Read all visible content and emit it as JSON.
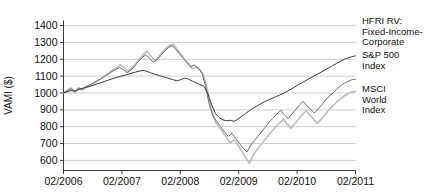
{
  "chart_data": {
    "type": "line",
    "title": "",
    "xlabel": "",
    "ylabel": "VAMI ($)",
    "ylim": [
      540,
      1430
    ],
    "yticks": [
      600,
      700,
      800,
      900,
      1000,
      1100,
      1200,
      1300,
      1400
    ],
    "ytick_labels": [
      "600",
      "700",
      "800",
      "900",
      "1000",
      "1100",
      "1200",
      "1300",
      "1400"
    ],
    "xticks": [
      "02/2006",
      "02/2007",
      "02/2008",
      "02/2009",
      "02/2010",
      "02/2011"
    ],
    "xlim": [
      0,
      60
    ],
    "grid": true,
    "legend_position": "right-outside",
    "series": [
      {
        "name": "HFRI RV: Fixed-Income-Corporate",
        "color": "#3c3c3c",
        "width": 1.0,
        "values": [
          1000,
          1008,
          1014,
          1012,
          1020,
          1028,
          1033,
          1040,
          1047,
          1055,
          1062,
          1070,
          1078,
          1085,
          1092,
          1098,
          1105,
          1110,
          1118,
          1124,
          1130,
          1134,
          1128,
          1120,
          1112,
          1105,
          1098,
          1092,
          1085,
          1078,
          1072,
          1080,
          1088,
          1082,
          1070,
          1060,
          1050,
          1040,
          1000,
          935,
          880,
          855,
          840,
          835,
          838,
          832,
          845,
          862,
          878,
          895,
          910,
          922,
          936,
          948,
          958,
          968,
          978,
          988,
          998,
          1010,
          1022,
          1036,
          1050,
          1062,
          1075,
          1088,
          1100,
          1112,
          1124,
          1138,
          1150,
          1162,
          1175,
          1188,
          1200,
          1208,
          1215,
          1220
        ]
      },
      {
        "name": "S&P 500 Index",
        "color": "#6e6e6e",
        "width": 1.0,
        "values": [
          1000,
          1012,
          1025,
          1008,
          1030,
          1022,
          1038,
          1048,
          1060,
          1072,
          1085,
          1098,
          1112,
          1128,
          1140,
          1152,
          1138,
          1120,
          1135,
          1160,
          1185,
          1210,
          1228,
          1205,
          1182,
          1198,
          1222,
          1248,
          1268,
          1282,
          1258,
          1232,
          1205,
          1180,
          1155,
          1165,
          1148,
          1120,
          1035,
          925,
          860,
          830,
          800,
          770,
          742,
          760,
          730,
          700,
          672,
          650,
          690,
          718,
          745,
          772,
          800,
          828,
          852,
          875,
          898,
          870,
          848,
          875,
          900,
          928,
          950,
          925,
          902,
          880,
          905,
          930,
          958,
          982,
          1000,
          1022,
          1042,
          1058,
          1068,
          1078,
          1082
        ]
      },
      {
        "name": "MSCI World Index",
        "color": "#bdbdbd",
        "width": 1.6,
        "values": [
          1000,
          1015,
          1030,
          1002,
          1028,
          1018,
          1035,
          1046,
          1058,
          1072,
          1088,
          1102,
          1118,
          1138,
          1152,
          1168,
          1150,
          1128,
          1145,
          1172,
          1200,
          1228,
          1248,
          1220,
          1192,
          1212,
          1240,
          1265,
          1282,
          1288,
          1258,
          1228,
          1198,
          1170,
          1142,
          1155,
          1135,
          1105,
          1015,
          900,
          832,
          798,
          768,
          735,
          705,
          722,
          690,
          655,
          618,
          582,
          630,
          662,
          692,
          720,
          748,
          775,
          800,
          822,
          845,
          815,
          790,
          818,
          845,
          872,
          895,
          868,
          842,
          820,
          845,
          872,
          900,
          925,
          945,
          965,
          982,
          995,
          1005,
          1010
        ]
      }
    ]
  },
  "legend": {
    "entries": [
      {
        "label_lines": [
          "HFRI RV:",
          "Fixed-Income-",
          "Corporate"
        ]
      },
      {
        "label_lines": [
          "S&P 500",
          "Index"
        ]
      },
      {
        "label_lines": [
          "MSCI",
          "World",
          "Index"
        ]
      }
    ]
  }
}
